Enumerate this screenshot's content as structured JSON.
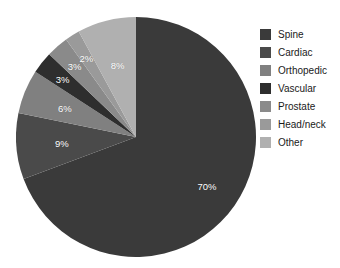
{
  "chart_data": {
    "type": "pie",
    "title": "",
    "labels": [
      "Spine",
      "Cardiac",
      "Orthopedic",
      "Vascular",
      "Prostate",
      "Head/neck",
      "Other"
    ],
    "values": [
      70,
      9,
      6,
      3,
      3,
      2,
      8
    ],
    "value_labels": [
      "70%",
      "9%",
      "6%",
      "3%",
      "3%",
      "2%",
      "8%"
    ],
    "unit": "%",
    "colors": [
      "#3a3a3a",
      "#4a4a4a",
      "#808080",
      "#2e2e2e",
      "#8a8a8a",
      "#9a9a9a",
      "#b0b0b0"
    ],
    "start_angle_deg": 0,
    "direction": "clockwise",
    "legend_position": "right",
    "grid": false,
    "slices": [
      {
        "label": "Spine",
        "value": 70,
        "display": "70%",
        "color": "#3a3a3a"
      },
      {
        "label": "Cardiac",
        "value": 9,
        "display": "9%",
        "color": "#4a4a4a"
      },
      {
        "label": "Orthopedic",
        "value": 6,
        "display": "6%",
        "color": "#808080"
      },
      {
        "label": "Vascular",
        "value": 3,
        "display": "3%",
        "color": "#2e2e2e"
      },
      {
        "label": "Prostate",
        "value": 3,
        "display": "3%",
        "color": "#8a8a8a"
      },
      {
        "label": "Head/neck",
        "value": 2,
        "display": "2%",
        "color": "#9a9a9a"
      },
      {
        "label": "Other",
        "value": 8,
        "display": "8%",
        "color": "#b0b0b0"
      }
    ]
  },
  "legend": {
    "items": [
      {
        "label": "Spine",
        "color": "#3a3a3a"
      },
      {
        "label": "Cardiac",
        "color": "#4a4a4a"
      },
      {
        "label": "Orthopedic",
        "color": "#808080"
      },
      {
        "label": "Vascular",
        "color": "#2e2e2e"
      },
      {
        "label": "Prostate",
        "color": "#8a8a8a"
      },
      {
        "label": "Head/neck",
        "color": "#9a9a9a"
      },
      {
        "label": "Other",
        "color": "#b0b0b0"
      }
    ]
  },
  "style": {
    "background": "#ffffff",
    "label_text_color": "#ffffff",
    "legend_text_color": "#1a1a1a"
  }
}
